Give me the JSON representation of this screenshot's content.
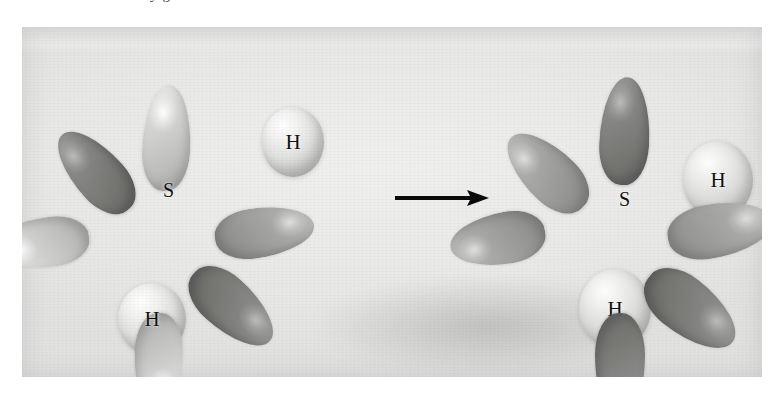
{
  "page": {
    "clipped_running_text": "y      g",
    "background_color": "#ffffff",
    "plate_background_color": "#ececeb"
  },
  "figure": {
    "type": "orbital-overlap-reaction-photograph",
    "caption_visible": false,
    "arrow": {
      "icon": "right-arrow-icon",
      "direction": "right",
      "color": "#0a0a0a"
    },
    "reactants": {
      "sulfur_atom": {
        "label": "S",
        "label_color": "#101010",
        "lobe_count": 6,
        "lobes": [
          {
            "name": "lobe-up",
            "shade": "light",
            "angle_deg": 3
          },
          {
            "name": "lobe-upper-left",
            "shade": "dark",
            "angle_deg": -42
          },
          {
            "name": "lobe-left",
            "shade": "light",
            "angle_deg": -97
          },
          {
            "name": "lobe-right",
            "shade": "mid",
            "angle_deg": 82
          },
          {
            "name": "lobe-lower-right",
            "shade": "dark",
            "angle_deg": 132
          },
          {
            "name": "lobe-down",
            "shade": "light",
            "angle_deg": 182
          }
        ]
      },
      "hydrogen_atoms": [
        {
          "label": "H",
          "name": "hydrogen-upper",
          "bonded": false
        },
        {
          "label": "H",
          "name": "hydrogen-lower",
          "bonded": false
        }
      ]
    },
    "products": {
      "sulfur_atom": {
        "label": "S",
        "label_color": "#101010",
        "lobe_count": 6,
        "lobes": [
          {
            "name": "lobe-up",
            "shade": "dark",
            "angle_deg": 3
          },
          {
            "name": "lobe-upper-left",
            "shade": "mid",
            "angle_deg": -46
          },
          {
            "name": "lobe-left",
            "shade": "mid",
            "angle_deg": -100
          },
          {
            "name": "lobe-right",
            "shade": "mid",
            "angle_deg": 80
          },
          {
            "name": "lobe-lower-right",
            "shade": "dark",
            "angle_deg": 128
          },
          {
            "name": "lobe-down",
            "shade": "dark",
            "angle_deg": 180
          }
        ]
      },
      "hydrogen_atoms": [
        {
          "label": "H",
          "name": "hydrogen-right",
          "bonded": true
        },
        {
          "label": "H",
          "name": "hydrogen-bottom",
          "bonded": true
        }
      ]
    },
    "colors": {
      "lobe_light": "#c8c8c7",
      "lobe_mid": "#a6a6a5",
      "lobe_dark": "#7e7e7d",
      "hydrogen_sphere": "#e2e2e1",
      "label_text": "#101010",
      "arrow": "#0a0a0a",
      "plate": "#ececeb"
    }
  }
}
